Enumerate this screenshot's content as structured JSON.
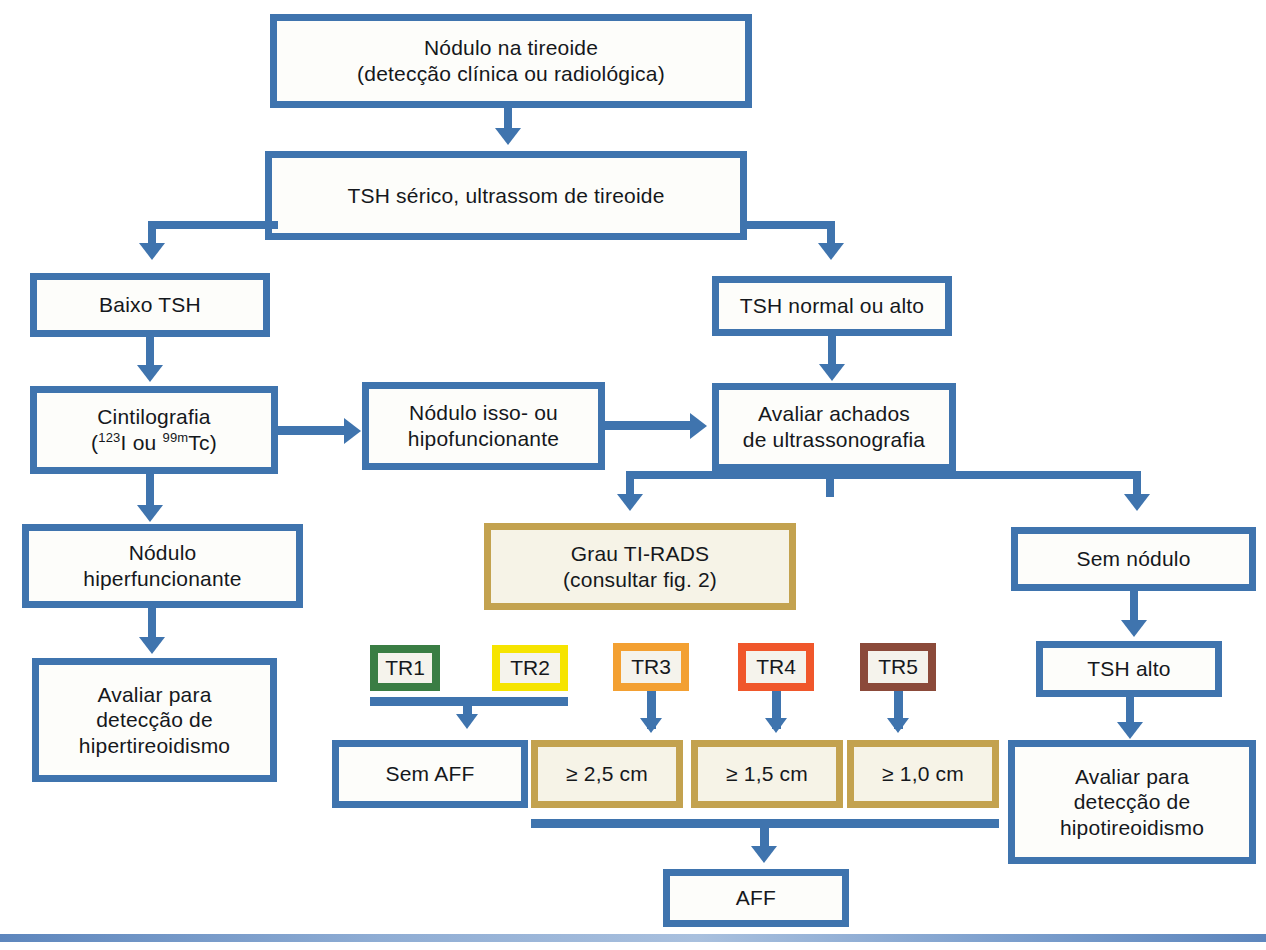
{
  "diagram": {
    "colors": {
      "blue": "#3f74ae",
      "gold": "#c3a24f",
      "tr1": "#3a7d44",
      "tr2": "#f6e400",
      "tr3": "#f3a032",
      "tr4": "#f0572b",
      "tr5": "#8b4a3a",
      "box_fill": "#fdfdfa",
      "gold_fill": "#f6f3e7"
    }
  },
  "nodes": {
    "nodulo_tireoide": {
      "line1": "Nódulo na tireoide",
      "line2": "(detecção clínica ou radiológica)"
    },
    "tsh_serico": {
      "line1": "TSH sérico, ultrassom de tireoide"
    },
    "baixo_tsh": {
      "line1": "Baixo TSH"
    },
    "tsh_normal_alto": {
      "line1": "TSH normal ou alto"
    },
    "cintilografia": {
      "line1": "Cintilografia",
      "line2_prefix": "(",
      "iso1_sup": "123",
      "iso1": "I",
      "mid": " ou ",
      "iso2_sup": "99m",
      "iso2": "Tc",
      "line2_suffix": ")"
    },
    "nodulo_iso_hipo": {
      "line1": "Nódulo isso- ou",
      "line2": "hipofuncionante"
    },
    "avaliar_achados": {
      "line1": "Avaliar achados",
      "line2": "de ultrassonografia"
    },
    "nodulo_hiper": {
      "line1": "Nódulo",
      "line2": "hiperfuncionante"
    },
    "grau_tirads": {
      "line1": "Grau TI-RADS",
      "line2": "(consultar fig. 2)"
    },
    "sem_nodulo": {
      "line1": "Sem nódulo"
    },
    "avaliar_hiper": {
      "line1": "Avaliar para",
      "line2": "detecção de",
      "line3": "hipertireoidismo"
    },
    "tsh_alto": {
      "line1": "TSH alto"
    },
    "avaliar_hipo": {
      "line1": "Avaliar para",
      "line2": "detecção de",
      "line3": "hipotireoidismo"
    },
    "sem_aff": {
      "line1": "Sem AFF"
    },
    "aff": {
      "line1": "AFF"
    }
  },
  "tirads_chips": [
    {
      "label": "TR1",
      "color": "#3a7d44"
    },
    {
      "label": "TR2",
      "color": "#f6e400"
    },
    {
      "label": "TR3",
      "color": "#f3a032"
    },
    {
      "label": "TR4",
      "color": "#f0572b"
    },
    {
      "label": "TR5",
      "color": "#8b4a3a"
    }
  ],
  "size_thresholds": [
    {
      "label": "≥ 2,5 cm",
      "for_chip": "TR3"
    },
    {
      "label": "≥ 1,5 cm",
      "for_chip": "TR4"
    },
    {
      "label": "≥ 1,0 cm",
      "for_chip": "TR5"
    }
  ]
}
